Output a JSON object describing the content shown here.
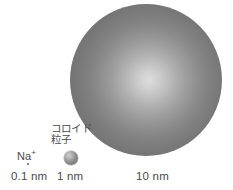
{
  "diagram": {
    "title_visible": false,
    "background_color": "#ffffff",
    "items": [
      {
        "id": "sodium-ion",
        "label": "Na",
        "label_superscript": "+",
        "scale_label": "0.1 nm",
        "shape": "dot",
        "color": "#5e5e5e"
      },
      {
        "id": "colloid-particle",
        "label_line1": "コロイド",
        "label_line2": "粒子",
        "scale_label": "1 nm",
        "shape": "sphere",
        "color": "#8a8a8a"
      },
      {
        "id": "large-sphere",
        "label_line1": "",
        "label_line2": "",
        "scale_label": "10 nm",
        "shape": "sphere",
        "color": "#8d8d8d"
      }
    ],
    "text_color": "#4a4a4a"
  }
}
